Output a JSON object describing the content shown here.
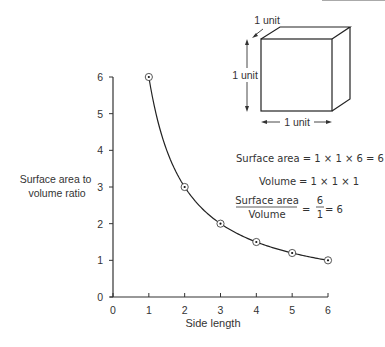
{
  "chart_data": {
    "type": "line",
    "title": "",
    "xlabel": "Side length",
    "ylabel": "Surface area to volume ratio",
    "ylabel_lines": [
      "Surface area to",
      "volume ratio"
    ],
    "x": [
      1,
      2,
      3,
      4,
      5,
      6
    ],
    "series": [
      {
        "name": "Surface area to volume ratio",
        "values": [
          6,
          3,
          2,
          1.5,
          1.2,
          1
        ],
        "marker": "circled-dot"
      }
    ],
    "xlim": [
      0,
      6
    ],
    "ylim": [
      0,
      6
    ],
    "xticks": [
      "0",
      "1",
      "2",
      "3",
      "4",
      "5",
      "6"
    ],
    "yticks": [
      "0",
      "1",
      "2",
      "3",
      "4",
      "5",
      "6"
    ],
    "grid": false,
    "legend": "none",
    "annotations": {
      "cube": {
        "depth_label": "1 unit",
        "height_label": "1 unit",
        "width_label": "1 unit"
      },
      "equations": {
        "surface_area": "Surface area = 1 × 1 × 6 = 6",
        "volume_label": "Volume",
        "volume_rhs": "= 1 × 1 × 1",
        "ratio_numerator": "Surface area",
        "ratio_denominator": "Volume",
        "ratio_eq1": "=",
        "ratio_frac_num": "6",
        "ratio_frac_den": "1",
        "ratio_result": "= 6"
      }
    }
  },
  "colors": {
    "line": "#222222",
    "text": "#333333",
    "axis": "#333333"
  }
}
